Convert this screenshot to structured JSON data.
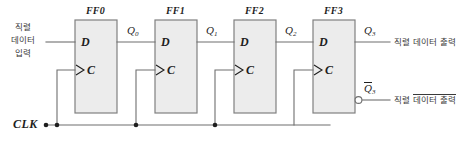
{
  "diagram": {
    "flipflops": [
      {
        "name": "FF0",
        "d_pin": "D",
        "c_pin": "C",
        "out_label": "Q",
        "out_sub": "0"
      },
      {
        "name": "FF1",
        "d_pin": "D",
        "c_pin": "C",
        "out_label": "Q",
        "out_sub": "1"
      },
      {
        "name": "FF2",
        "d_pin": "D",
        "c_pin": "C",
        "out_label": "Q",
        "out_sub": "2"
      },
      {
        "name": "FF3",
        "d_pin": "D",
        "c_pin": "C",
        "out_label": "Q",
        "out_sub": "3"
      }
    ],
    "clock_label": "CLK",
    "input_label": {
      "line1": "직렬",
      "line2": "데이터",
      "line3": "입력"
    },
    "output_label": {
      "prefix": "직렬 ",
      "text": "데이터 출력"
    },
    "inverted_output_label": {
      "prefix": "직렬 ",
      "overlined": "데이터 출력"
    },
    "q_out": {
      "letter": "Q",
      "sub": "3"
    },
    "qbar_out": {
      "letter": "Q",
      "sub": "3"
    },
    "colors": {
      "box_fill": "#ececec",
      "box_stroke": "#808080",
      "wire": "#6f6f6f",
      "text": "#1e1e1e",
      "korean_text": "#3a3a3a",
      "background": "#ffffff"
    }
  }
}
